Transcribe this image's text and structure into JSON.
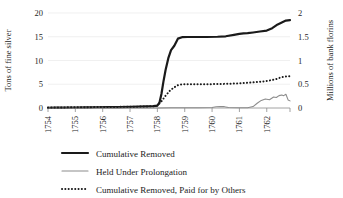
{
  "chart_data": {
    "type": "line",
    "title": "",
    "xlabel": "",
    "ylabel": "Tons of fine silver",
    "y2label": "Millions of bank florins",
    "grid": true,
    "legend_position": "bottom",
    "xlim": [
      1754,
      1762.85
    ],
    "ylim": [
      0,
      20
    ],
    "y2lim": [
      0,
      2
    ],
    "xtick_labels": [
      "1754",
      "1755",
      "1756",
      "1757",
      "1758",
      "1759",
      "1760",
      "1761",
      "1762"
    ],
    "xticks": [
      1754,
      1755,
      1756,
      1757,
      1758,
      1759,
      1760,
      1761,
      1762
    ],
    "ytick_labels": [
      "0",
      "5",
      "10",
      "15",
      "20"
    ],
    "yticks": [
      0,
      5,
      10,
      15,
      20
    ],
    "y2tick_labels": [
      "0",
      "0.5",
      "1",
      "1.5",
      "2"
    ],
    "y2ticks": [
      0,
      0.5,
      1,
      1.5,
      2
    ],
    "series": [
      {
        "name": "Cumulative Removed",
        "style": "solid-thick",
        "color": "#1a1a1a",
        "width": 2.2,
        "x": [
          1754.0,
          1754.3,
          1754.6,
          1755.0,
          1755.4,
          1755.8,
          1756.2,
          1756.6,
          1757.0,
          1757.3,
          1757.6,
          1757.85,
          1758.0,
          1758.08,
          1758.15,
          1758.22,
          1758.3,
          1758.4,
          1758.5,
          1758.62,
          1758.75,
          1758.9,
          1759.1,
          1759.4,
          1759.8,
          1760.2,
          1760.5,
          1760.8,
          1761.0,
          1761.15,
          1761.3,
          1761.5,
          1761.75,
          1762.0,
          1762.2,
          1762.4,
          1762.55,
          1762.7,
          1762.85
        ],
        "y": [
          0.05,
          0.07,
          0.09,
          0.11,
          0.14,
          0.16,
          0.18,
          0.2,
          0.25,
          0.3,
          0.35,
          0.4,
          0.5,
          1.2,
          3.0,
          5.5,
          8.0,
          10.5,
          12.2,
          13.1,
          14.6,
          14.9,
          14.95,
          14.95,
          14.95,
          15.0,
          15.1,
          15.4,
          15.6,
          15.7,
          15.75,
          15.9,
          16.1,
          16.3,
          16.8,
          17.6,
          18.0,
          18.4,
          18.5
        ]
      },
      {
        "name": "Held Under Prolongation",
        "style": "solid-thin",
        "color": "#8c8c8c",
        "width": 1.1,
        "x": [
          1754.0,
          1755.0,
          1756.0,
          1757.0,
          1758.0,
          1758.5,
          1759.0,
          1759.5,
          1760.0,
          1760.15,
          1760.3,
          1760.45,
          1760.6,
          1761.0,
          1761.3,
          1761.5,
          1761.65,
          1761.8,
          1761.95,
          1762.1,
          1762.25,
          1762.35,
          1762.45,
          1762.55,
          1762.62,
          1762.7,
          1762.78,
          1762.85
        ],
        "y": [
          0.0,
          0.0,
          0.0,
          0.0,
          0.0,
          0.05,
          0.05,
          0.05,
          0.1,
          0.25,
          0.3,
          0.28,
          0.12,
          0.05,
          0.05,
          0.3,
          1.0,
          1.6,
          1.9,
          1.75,
          2.3,
          2.2,
          2.6,
          2.75,
          2.6,
          2.9,
          1.7,
          1.5
        ]
      },
      {
        "name": "Cumulative Removed, Paid for by Others",
        "style": "dotted",
        "color": "#1a1a1a",
        "width": 2.0,
        "x": [
          1754.0,
          1754.4,
          1754.8,
          1755.2,
          1755.6,
          1756.0,
          1756.4,
          1756.8,
          1757.2,
          1757.6,
          1757.85,
          1758.0,
          1758.15,
          1758.3,
          1758.45,
          1758.6,
          1758.75,
          1758.9,
          1759.1,
          1759.4,
          1759.8,
          1760.2,
          1760.6,
          1761.0,
          1761.3,
          1761.6,
          1761.9,
          1762.1,
          1762.3,
          1762.5,
          1762.65,
          1762.78,
          1762.85
        ],
        "y": [
          0.1,
          0.12,
          0.14,
          0.16,
          0.18,
          0.2,
          0.22,
          0.25,
          0.28,
          0.32,
          0.38,
          0.5,
          1.4,
          2.6,
          3.6,
          4.3,
          4.8,
          5.0,
          5.0,
          5.0,
          5.0,
          5.05,
          5.1,
          5.2,
          5.3,
          5.45,
          5.6,
          5.8,
          6.0,
          6.4,
          6.6,
          6.7,
          6.7
        ]
      }
    ]
  },
  "legend": {
    "items": [
      {
        "label": "Cumulative Removed"
      },
      {
        "label": "Held Under Prolongation"
      },
      {
        "label": "Cumulative Removed, Paid for by Others"
      }
    ]
  }
}
